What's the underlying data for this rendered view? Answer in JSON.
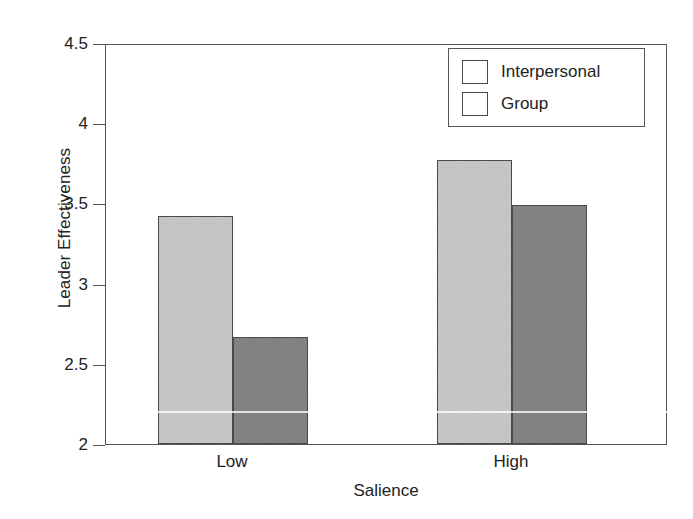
{
  "chart_data": {
    "type": "bar",
    "title": "",
    "xlabel": "Salience",
    "ylabel": "Leader Effectiveness",
    "categories": [
      "Low",
      "High"
    ],
    "series": [
      {
        "name": "Interpersonal",
        "values": [
          3.42,
          3.77
        ],
        "color": "#cccccc"
      },
      {
        "name": "Group",
        "values": [
          2.67,
          3.49
        ],
        "color": "#8a8a8a"
      }
    ],
    "ylim": [
      2,
      4.5
    ],
    "ytick_values": [
      2,
      2.5,
      3,
      3.5,
      4,
      4.5
    ],
    "ytick_labels": [
      "2",
      "2.5",
      "3",
      "3.5",
      "4",
      "4.5"
    ],
    "grid": false,
    "legend_position": "top-right",
    "bar_style": "grouped-adjacent",
    "frame": "full-box"
  },
  "legend": {
    "entries": [
      {
        "label": "Interpersonal"
      },
      {
        "label": "Group"
      }
    ]
  },
  "axes": {
    "y_title": "Leader Effectiveness",
    "x_title": "Salience",
    "y_ticks": [
      "2",
      "2.5",
      "3",
      "3.5",
      "4",
      "4.5"
    ],
    "x_ticks": [
      "Low",
      "High"
    ]
  }
}
